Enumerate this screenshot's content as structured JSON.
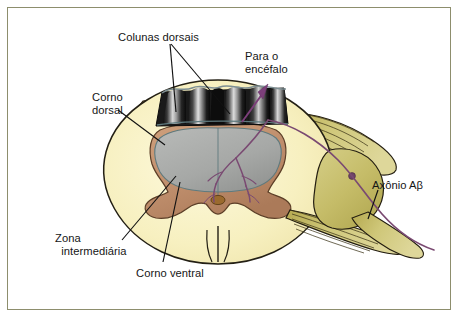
{
  "figure": {
    "background_color": "#ffffff",
    "border_color": "#8d8e6d"
  },
  "labels": [
    {
      "id": "colunas-dorsais",
      "text": "Colunas dorsais",
      "x": 118,
      "y": 31
    },
    {
      "id": "para-o-encefalo",
      "text": "Para o\nencéfalo",
      "x": 245,
      "y": 50
    },
    {
      "id": "corno-dorsal",
      "text": "Corno\ndorsal",
      "x": 92,
      "y": 91
    },
    {
      "id": "axonio-ab",
      "text": "Axônio Aβ",
      "x": 372,
      "y": 179
    },
    {
      "id": "zona-intermediaria",
      "text": "Zona\n  intermediária",
      "x": 55,
      "y": 232
    },
    {
      "id": "corno-ventral",
      "text": "Corno ventral",
      "x": 136,
      "y": 267
    }
  ],
  "anatomy": {
    "white_matter_label": "substância branca",
    "white_matter_color": "#f7f1c4",
    "gray_matter_label": "substância cinzenta",
    "gray_matter_color": "#a8aaa8",
    "horn_color": "#c08f6d",
    "dorsal_column_label": "colunas dorsais",
    "dorsal_column_color": "#2b2b2b",
    "nerve_root_label": "raiz dorsal",
    "nerve_root_color": "#cbc268",
    "ganglion_label": "gânglio da raiz dorsal",
    "ganglion_color": "#c9c073",
    "axon_label": "axônio Aβ",
    "axon_color": "#7a4a72",
    "arrow_label": "seta para o encéfalo",
    "arrow_color": "#7c3f7a",
    "central_canal_label": "canal central",
    "central_canal_color": "#9a6a2e"
  }
}
